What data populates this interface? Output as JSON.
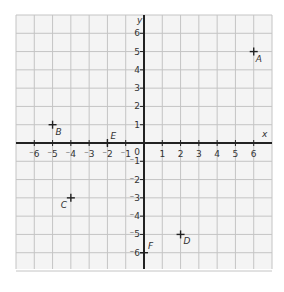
{
  "chart_data": {
    "type": "scatter",
    "title": "",
    "xlabel": "x",
    "ylabel": "y",
    "xlim": [
      -7,
      7
    ],
    "ylim": [
      -7,
      7
    ],
    "grid": true,
    "x_ticks": [
      "-6",
      "-5",
      "-4",
      "-3",
      "-2",
      "-1",
      "1",
      "2",
      "3",
      "4",
      "5",
      "6"
    ],
    "y_ticks": [
      "6",
      "5",
      "4",
      "3",
      "2",
      "1",
      "-1",
      "-2",
      "-3",
      "-4",
      "-5",
      "-6"
    ],
    "origin_label": "0",
    "points": [
      {
        "label": "A",
        "x": 6,
        "y": 5
      },
      {
        "label": "B",
        "x": -5,
        "y": 1
      },
      {
        "label": "C",
        "x": -4,
        "y": -3
      },
      {
        "label": "D",
        "x": 2,
        "y": -5
      },
      {
        "label": "E",
        "x": -2,
        "y": 0
      },
      {
        "label": "F",
        "x": 0,
        "y": -6
      }
    ]
  },
  "colors": {
    "grid": "#c4c4c4",
    "grid_bg": "#f4f4f4",
    "axis": "#222222",
    "text": "#333333"
  }
}
